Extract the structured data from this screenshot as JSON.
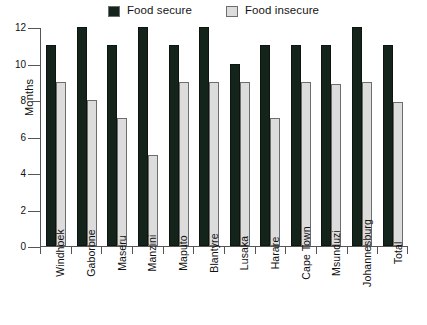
{
  "chart_data": {
    "type": "bar",
    "title": "",
    "subtitle": "",
    "xlabel": "",
    "ylabel": "Months",
    "ylim": [
      0,
      12
    ],
    "yticks": [
      0,
      2,
      4,
      6,
      8,
      10,
      12
    ],
    "grid": false,
    "legend_position": "top-center",
    "categories": [
      "Windhoek",
      "Gaborone",
      "Maseru",
      "Manzini",
      "Maputo",
      "Blantyre",
      "Lusaka",
      "Harare",
      "Cape Town",
      "Msunduzi",
      "Johannesburg",
      "Total"
    ],
    "series": [
      {
        "name": "Food secure",
        "color": "#14241a",
        "values": [
          11,
          12,
          11,
          12,
          11,
          12,
          10,
          11,
          11,
          11,
          12,
          11
        ]
      },
      {
        "name": "Food insecure",
        "color": "#dcdcdc",
        "values": [
          9,
          8,
          7,
          5,
          9,
          9,
          9,
          7,
          9,
          8.9,
          9,
          7.9
        ]
      }
    ]
  },
  "legend": {
    "items": [
      {
        "label": "Food secure",
        "swatch_name": "legend-swatch-food-secure"
      },
      {
        "label": "Food insecure",
        "swatch_name": "legend-swatch-food-insecure"
      }
    ]
  }
}
